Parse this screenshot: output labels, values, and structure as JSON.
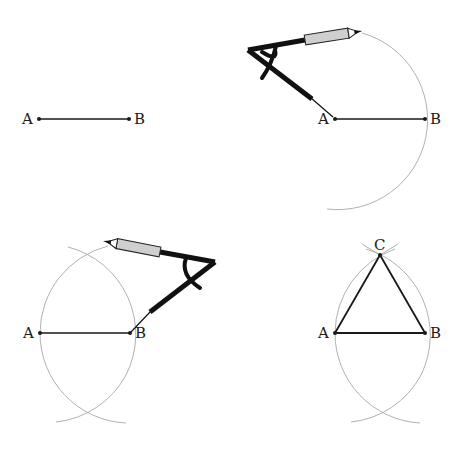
{
  "colors": {
    "segment": "#1a1a1a",
    "arc": "#a8a8a8",
    "compass": "#111111",
    "pencil_body": "#cfcfcf"
  },
  "panels": [
    {
      "step": 1,
      "description": "Segment AB",
      "labels": {
        "a": "A",
        "b": "B"
      },
      "points": {
        "A": [
          39,
          119
        ],
        "B": [
          129,
          119
        ]
      }
    },
    {
      "step": 2,
      "description": "Compass centered at A with radius AB draws an arc through B",
      "labels": {
        "a": "A",
        "b": "B"
      },
      "points": {
        "A": [
          335,
          119
        ],
        "B": [
          425,
          119
        ]
      },
      "arc": {
        "center": "A",
        "radius": 90
      },
      "tool": "compass-icon"
    },
    {
      "step": 3,
      "description": "Compass centered at B with radius BA draws a second arc intersecting the first",
      "labels": {
        "a": "A",
        "b": "B"
      },
      "points": {
        "A": [
          40,
          333
        ],
        "B": [
          130,
          333
        ]
      },
      "arcs": [
        {
          "center": "A",
          "radius": 90
        },
        {
          "center": "B",
          "radius": 90
        }
      ],
      "tool": "compass-icon"
    },
    {
      "step": 4,
      "description": "Intersection point C joined to A and B forms equilateral triangle ABC",
      "labels": {
        "a": "A",
        "b": "B",
        "c": "C"
      },
      "points": {
        "A": [
          335,
          333
        ],
        "B": [
          425,
          333
        ],
        "C": [
          380,
          255
        ]
      }
    }
  ]
}
